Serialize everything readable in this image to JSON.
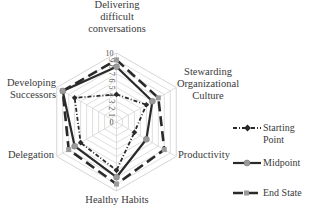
{
  "chart_data": {
    "type": "radar",
    "title": "",
    "axes": [
      "Delivering difficult conversations",
      "Stewarding Organizational Culture",
      "Productivity",
      "Healthy Habits",
      "Delegation",
      "Developing Successors"
    ],
    "axis_label_lines": [
      [
        "Delivering",
        "difficult",
        "conversations"
      ],
      [
        "Stewarding",
        "Organizational",
        "Culture"
      ],
      [
        "Productivity"
      ],
      [
        "Healthy Habits"
      ],
      [
        "Delegation"
      ],
      [
        "Developing",
        "Successors"
      ]
    ],
    "rlim": [
      0,
      10
    ],
    "ticks": [
      "0",
      "1",
      "2",
      "3",
      "4",
      "5",
      "6",
      "7",
      "8",
      "9",
      "10"
    ],
    "grid": true,
    "legend_position": "right",
    "series": [
      {
        "name": "Starting Point",
        "values": [
          4,
          5,
          3,
          7,
          6,
          7
        ],
        "style": "dash-dot",
        "marker": "diamond",
        "color": "#2a2a2a"
      },
      {
        "name": "Midpoint",
        "values": [
          8,
          6,
          5,
          8,
          7,
          9
        ],
        "style": "solid",
        "marker": "circle",
        "color": "#2a2a2a",
        "marker_color": "#9a9a9a"
      },
      {
        "name": "End State",
        "values": [
          9,
          7,
          8,
          9,
          8,
          9
        ],
        "style": "long-dash",
        "marker": "square",
        "color": "#2a2a2a",
        "marker_color": "#9a9a9a"
      }
    ]
  },
  "legend": {
    "items": [
      {
        "label_lines": [
          "Starting",
          "Point"
        ]
      },
      {
        "label_lines": [
          "Midpoint"
        ]
      },
      {
        "label_lines": [
          "End State"
        ]
      }
    ]
  }
}
